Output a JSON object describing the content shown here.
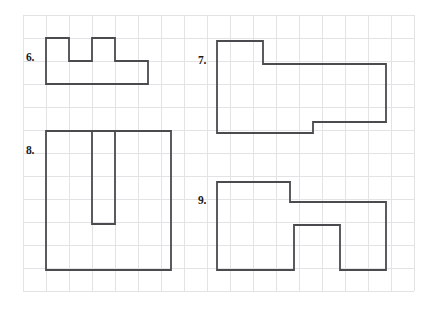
{
  "page": {
    "background_color": "#ffffff",
    "width": 428,
    "height": 312
  },
  "grid": {
    "origin_x": 23,
    "origin_y": 15,
    "cell_size": 23,
    "cols": 17,
    "rows": 12,
    "line_color": "#e3e3e6",
    "line_width": 1
  },
  "shape_style": {
    "stroke_color": "#4a4a4f",
    "stroke_width": 1.8,
    "fill": "none"
  },
  "problems": [
    {
      "number": "6.",
      "label_x": 26,
      "label_y": 52,
      "points": "46,38 69,38 69,61 92,61 92,38 115,38 115,61 148,61 148,84 46,84"
    },
    {
      "number": "7.",
      "label_x": 198,
      "label_y": 55,
      "points": "217,41 263,41 263,64 386,64 386,122 313,122 313,133 217,133"
    },
    {
      "number": "8.",
      "label_x": 26,
      "label_y": 145,
      "points": "46,131 115,131 115,224 92,224 92,131 171,131 171,270 46,270"
    },
    {
      "number": "9.",
      "label_x": 198,
      "label_y": 195,
      "points": "217,182 290,182 290,202 386,202 386,270 340,270 340,225 294,225 294,270 217,270"
    }
  ]
}
